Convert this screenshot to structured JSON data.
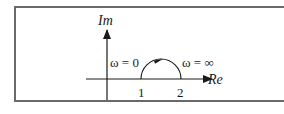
{
  "diagram": {
    "type": "nyquist-plot",
    "axes": {
      "imaginary_label": "Im",
      "real_label": "Re"
    },
    "ticks": [
      {
        "label": "1",
        "value": 1
      },
      {
        "label": "2",
        "value": 2
      }
    ],
    "annotations": {
      "start": "ω = 0",
      "end": "ω = ∞"
    },
    "curve": {
      "shape": "semicircle",
      "from": 1,
      "to": 2,
      "direction": "clockwise",
      "half_plane": "upper"
    },
    "colors": {
      "stroke": "#1a1a1a",
      "frame": "#6a6a6a",
      "background": "#ffffff"
    }
  }
}
